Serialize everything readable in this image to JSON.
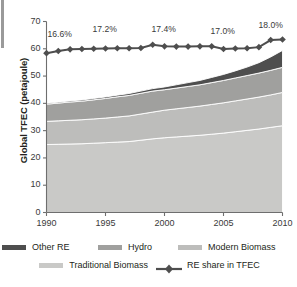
{
  "chart_data": {
    "type": "area",
    "title": "",
    "xlabel": "",
    "ylabel": "Global TFEC (petajoule)",
    "xlim": [
      1990,
      2010
    ],
    "ylim": [
      0,
      70
    ],
    "yticks": [
      0,
      10,
      20,
      30,
      40,
      50,
      60,
      70
    ],
    "xticks": [
      1990,
      1995,
      2000,
      2005,
      2010
    ],
    "grid": false,
    "legend_position": "bottom",
    "x": [
      1990,
      1991,
      1992,
      1993,
      1994,
      1995,
      1996,
      1997,
      1998,
      1999,
      2000,
      2001,
      2002,
      2003,
      2004,
      2005,
      2006,
      2007,
      2008,
      2009,
      2010
    ],
    "series": [
      {
        "name": "Traditional Biomass",
        "stack_order": 1,
        "color": "#c9c9c7",
        "values": [
          24.9,
          25.0,
          25.1,
          25.2,
          25.4,
          25.6,
          25.8,
          26.0,
          26.5,
          27.0,
          27.4,
          27.7,
          28.0,
          28.3,
          28.7,
          29.1,
          29.6,
          30.1,
          30.6,
          31.2,
          31.8
        ]
      },
      {
        "name": "Modern Biomass",
        "stack_order": 2,
        "color": "#bdbdbb",
        "values": [
          8.5,
          8.6,
          8.7,
          8.8,
          8.9,
          9.0,
          9.2,
          9.4,
          9.6,
          9.8,
          10.1,
          10.3,
          10.5,
          10.7,
          10.9,
          11.1,
          11.3,
          11.5,
          11.7,
          11.9,
          12.2
        ]
      },
      {
        "name": "Hydro",
        "stack_order": 3,
        "color": "#a0a09e",
        "values": [
          6.3,
          6.5,
          6.7,
          6.8,
          7.0,
          7.2,
          7.4,
          7.5,
          7.6,
          7.7,
          7.5,
          7.6,
          7.7,
          7.8,
          8.0,
          8.2,
          8.4,
          8.6,
          8.8,
          9.0,
          9.2
        ]
      },
      {
        "name": "Other RE",
        "stack_order": 4,
        "color": "#4e4e4e",
        "values": [
          0.3,
          0.35,
          0.4,
          0.45,
          0.5,
          0.55,
          0.6,
          0.7,
          0.8,
          0.9,
          1.0,
          1.2,
          1.4,
          1.6,
          1.9,
          2.2,
          2.6,
          3.1,
          3.8,
          4.9,
          6.2
        ]
      }
    ],
    "line_series": {
      "name": "RE share in TFEC",
      "color": "#4e4e4e",
      "marker": "diamond",
      "values": [
        58.4,
        59.2,
        59.8,
        59.9,
        60.0,
        60.1,
        60.2,
        60.2,
        60.3,
        61.5,
        60.9,
        60.8,
        60.8,
        60.9,
        60.9,
        59.9,
        60.1,
        60.2,
        60.6,
        63.2,
        63.4
      ]
    },
    "annotations": [
      {
        "text": "16.6%",
        "x": 1990,
        "y": 65.0
      },
      {
        "text": "17.2%",
        "x": 1995,
        "y": 67.0
      },
      {
        "text": "17.4%",
        "x": 2000,
        "y": 67.0
      },
      {
        "text": "17.0%",
        "x": 2005,
        "y": 66.0
      },
      {
        "text": "18.0%",
        "x": 2010,
        "y": 68.5
      }
    ],
    "legend": [
      {
        "label": "Other RE",
        "color": "#4e4e4e",
        "kind": "swatch"
      },
      {
        "label": "Hydro",
        "color": "#a0a09e",
        "kind": "swatch"
      },
      {
        "label": "Modern Biomass",
        "color": "#bdbdbb",
        "kind": "swatch"
      },
      {
        "label": "Traditional Biomass",
        "color": "#c9c9c7",
        "kind": "swatch"
      },
      {
        "label": "RE share in TFEC",
        "color": "#4e4e4e",
        "kind": "line-marker"
      }
    ]
  },
  "axis": {
    "ylabel": "Global TFEC (petajoule)",
    "yticks": [
      "70",
      "60",
      "50",
      "40",
      "30",
      "20",
      "10",
      "0"
    ],
    "xticks": [
      "1990",
      "1995",
      "2000",
      "2005",
      "2010"
    ]
  },
  "annotations": {
    "a0": "16.6%",
    "a1": "17.2%",
    "a2": "17.4%",
    "a3": "17.0%",
    "a4": "18.0%"
  },
  "legend": {
    "other_re": "Other RE",
    "hydro": "Hydro",
    "modern_biomass": "Modern Biomass",
    "traditional_biomass": "Traditional Biomass",
    "re_share": "RE share in TFEC"
  },
  "colors": {
    "other_re": "#4e4e4e",
    "hydro": "#a0a09e",
    "modern_biomass": "#bdbdbb",
    "traditional_biomass": "#c9c9c7",
    "line": "#4e4e4e",
    "axis": "#6e6e6e",
    "text": "#231f20"
  }
}
